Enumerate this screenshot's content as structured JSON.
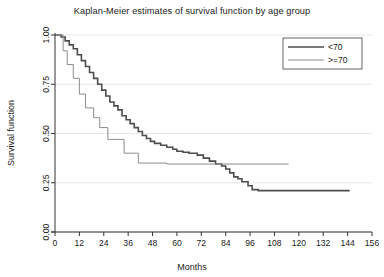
{
  "chart_data": {
    "type": "line",
    "title": "Kaplan-Meier estimates of survival function by age group",
    "xlabel": "Months",
    "ylabel": "Survival function",
    "xlim": [
      0,
      156
    ],
    "ylim": [
      0,
      1.0
    ],
    "xticks": [
      0,
      12,
      24,
      36,
      48,
      60,
      72,
      84,
      96,
      108,
      120,
      132,
      144,
      156
    ],
    "yticks": [
      0.0,
      0.25,
      0.5,
      0.75,
      1.0
    ],
    "ytick_labels": [
      "0.00",
      "0.25",
      "0.50",
      "0.75",
      "1.00"
    ],
    "xtick_labels": [
      "0",
      "12",
      "24",
      "36",
      "48",
      "60",
      "72",
      "84",
      "96",
      "108",
      "120",
      "132",
      "144",
      "156"
    ],
    "grid": "horizontal",
    "grid_color": "#e8e8e8",
    "legend_position": "top-right",
    "step_style": "post",
    "series": [
      {
        "name": "<70",
        "color": "#4d4d4d",
        "line_width": 1.6,
        "points": [
          [
            0,
            1.0
          ],
          [
            3,
            0.99
          ],
          [
            5,
            0.97
          ],
          [
            7,
            0.95
          ],
          [
            9,
            0.93
          ],
          [
            11,
            0.9
          ],
          [
            13,
            0.87
          ],
          [
            15,
            0.84
          ],
          [
            17,
            0.81
          ],
          [
            19,
            0.78
          ],
          [
            21,
            0.75
          ],
          [
            23,
            0.72
          ],
          [
            25,
            0.69
          ],
          [
            27,
            0.66
          ],
          [
            29,
            0.64
          ],
          [
            31,
            0.62
          ],
          [
            33,
            0.59
          ],
          [
            35,
            0.57
          ],
          [
            37,
            0.55
          ],
          [
            39,
            0.53
          ],
          [
            41,
            0.51
          ],
          [
            43,
            0.49
          ],
          [
            45,
            0.475
          ],
          [
            47,
            0.46
          ],
          [
            49,
            0.45
          ],
          [
            52,
            0.44
          ],
          [
            55,
            0.43
          ],
          [
            58,
            0.42
          ],
          [
            60,
            0.41
          ],
          [
            63,
            0.405
          ],
          [
            66,
            0.4
          ],
          [
            70,
            0.39
          ],
          [
            73,
            0.375
          ],
          [
            76,
            0.36
          ],
          [
            79,
            0.345
          ],
          [
            82,
            0.335
          ],
          [
            84,
            0.32
          ],
          [
            86,
            0.3
          ],
          [
            88,
            0.28
          ],
          [
            90,
            0.27
          ],
          [
            92,
            0.255
          ],
          [
            95,
            0.235
          ],
          [
            97,
            0.215
          ],
          [
            100,
            0.21
          ],
          [
            145,
            0.21
          ]
        ]
      },
      {
        "name": ">=70",
        "color": "#8c8c8c",
        "line_width": 1.0,
        "points": [
          [
            0,
            1.0
          ],
          [
            4,
            0.92
          ],
          [
            6,
            0.85
          ],
          [
            9,
            0.78
          ],
          [
            12,
            0.7
          ],
          [
            15,
            0.63
          ],
          [
            19,
            0.58
          ],
          [
            22,
            0.53
          ],
          [
            26,
            0.47
          ],
          [
            33,
            0.47
          ],
          [
            34,
            0.4
          ],
          [
            40,
            0.4
          ],
          [
            41,
            0.35
          ],
          [
            50,
            0.35
          ],
          [
            55,
            0.345
          ],
          [
            60,
            0.345
          ],
          [
            70,
            0.345
          ],
          [
            90,
            0.345
          ],
          [
            115,
            0.345
          ]
        ]
      }
    ],
    "legend_entries": [
      {
        "label": "<70",
        "color": "#4d4d4d",
        "line_width": 1.6
      },
      {
        "label": ">=70",
        "color": "#8c8c8c",
        "line_width": 1.0
      }
    ]
  }
}
